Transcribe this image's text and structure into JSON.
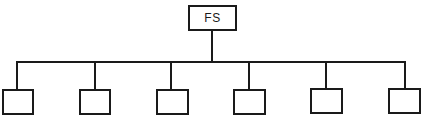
{
  "diagram": {
    "type": "tree",
    "root": {
      "label": "FS",
      "x": 188,
      "y": 5,
      "w": 49,
      "h": 26
    },
    "bus": {
      "y": 62,
      "x1": 17,
      "x2": 405
    },
    "root_drop": {
      "x": 212,
      "y1": 31,
      "y2": 62
    },
    "children": [
      {
        "label": "",
        "x": 2,
        "y": 89,
        "w": 32,
        "h": 26,
        "drop_x": 17
      },
      {
        "label": "",
        "x": 79,
        "y": 89,
        "w": 32,
        "h": 26,
        "drop_x": 95
      },
      {
        "label": "",
        "x": 156,
        "y": 89,
        "w": 33,
        "h": 26,
        "drop_x": 171
      },
      {
        "label": "",
        "x": 233,
        "y": 89,
        "w": 33,
        "h": 26,
        "drop_x": 249
      },
      {
        "label": "",
        "x": 310,
        "y": 88,
        "w": 33,
        "h": 26,
        "drop_x": 326
      },
      {
        "label": "",
        "x": 388,
        "y": 88,
        "w": 33,
        "h": 26,
        "drop_x": 405
      }
    ],
    "line_color": "#1a1a1a"
  }
}
